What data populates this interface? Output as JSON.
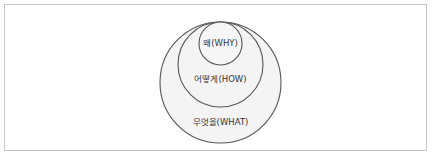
{
  "diagram": {
    "type": "nested-circles",
    "circles": [
      {
        "id": "outer",
        "label": "무엇을(WHAT)",
        "cx": 220.5,
        "cy": 82.5,
        "r": 60.5,
        "label_y": 125
      },
      {
        "id": "middle",
        "label": "어떻게(HOW)",
        "cx": 220.5,
        "cy": 64.5,
        "r": 42.5,
        "label_y": 82
      },
      {
        "id": "inner",
        "label": "왜(WHY)",
        "cx": 220.5,
        "cy": 43.5,
        "r": 21.5,
        "label_y": 46
      }
    ],
    "colors": {
      "stroke": "#555555",
      "fill_outer": "#f4f4f4",
      "fill_middle": "#f4f4f4",
      "fill_inner": "#f6f6f6",
      "frame_border": "#c6c6c6"
    }
  }
}
